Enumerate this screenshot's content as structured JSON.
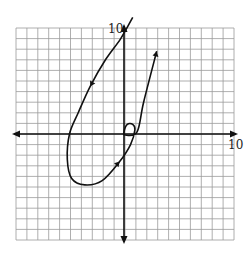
{
  "chart_data": {
    "type": "line",
    "title": "",
    "xlabel": "",
    "ylabel": "",
    "xlim": [
      -10,
      10
    ],
    "ylim": [
      -10,
      10
    ],
    "grid": true,
    "tick_labels": {
      "x_max": "10",
      "y_max": "10"
    },
    "series": [
      {
        "name": "parametric curve",
        "direction": "starts upper-left off-grid, travels down-left, loops through bottom, up through origin with a small curl, ends with arrow upper-right",
        "points": [
          [
            0.8,
            11.0
          ],
          [
            -0.3,
            9.0
          ],
          [
            -1.7,
            7.0
          ],
          [
            -3.1,
            4.5
          ],
          [
            -4.2,
            2.0
          ],
          [
            -5.0,
            0.0
          ],
          [
            -5.2,
            -2.4
          ],
          [
            -4.8,
            -4.2
          ],
          [
            -3.6,
            -4.8
          ],
          [
            -2.0,
            -4.4
          ],
          [
            -0.4,
            -2.6
          ],
          [
            0.6,
            -1.0
          ],
          [
            1.0,
            0.4
          ],
          [
            0.8,
            0.9
          ],
          [
            0.3,
            0.9
          ],
          [
            0.0,
            0.2
          ],
          [
            0.1,
            -0.1
          ],
          [
            1.2,
            0.2
          ],
          [
            1.8,
            3.0
          ],
          [
            3.0,
            7.8
          ]
        ],
        "arrows_at": [
          [
            -3.1,
            4.5
          ],
          [
            -0.4,
            -2.6
          ],
          [
            3.0,
            7.8
          ]
        ]
      }
    ]
  },
  "labels": {
    "x_axis_max": "10",
    "y_axis_max": "10"
  },
  "colors": {
    "grid": "#9a9a9a",
    "axis": "#111111",
    "curve": "#111111"
  }
}
